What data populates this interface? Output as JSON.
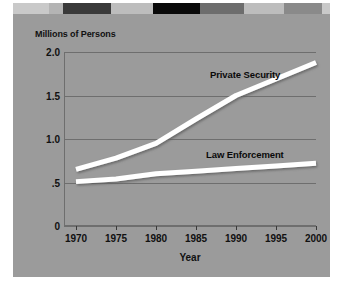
{
  "figure": {
    "background_color": "#9b9b9b",
    "page_color": "#ffffff",
    "series_line_color": "#ffffff",
    "gridline_color": "#6e6e6e",
    "text_color": "#111111"
  },
  "decorative_band": {
    "name": "top-decorative-band",
    "segments": [
      {
        "x": 0,
        "width": 36,
        "color": "#c9c9c9"
      },
      {
        "x": 36,
        "width": 14,
        "color": "#b4b4b4"
      },
      {
        "x": 50,
        "width": 48,
        "color": "#3a3a3a"
      },
      {
        "x": 98,
        "width": 42,
        "color": "#bdbdbd"
      },
      {
        "x": 140,
        "width": 47,
        "color": "#0a0a0a"
      },
      {
        "x": 187,
        "width": 44,
        "color": "#6d6d6d"
      },
      {
        "x": 231,
        "width": 40,
        "color": "#bdbdbd"
      },
      {
        "x": 271,
        "width": 38,
        "color": "#8a8a8a"
      },
      {
        "x": 309,
        "width": 8,
        "color": "#c9c9c9"
      }
    ]
  },
  "chart_data": {
    "type": "line",
    "title": "",
    "xlabel": "Year",
    "ylabel": "Millions of Persons",
    "x": [
      1970,
      1975,
      1980,
      1985,
      1990,
      1995,
      2000
    ],
    "xlim": [
      1968.5,
      2000
    ],
    "ylim": [
      0,
      2.0
    ],
    "ytick_labels": [
      "2.0",
      "1.5",
      "1.0",
      ".5",
      "0"
    ],
    "ytick_values": [
      2.0,
      1.5,
      1.0,
      0.5,
      0
    ],
    "xtick_labels": [
      "1970",
      "1975",
      "1980",
      "1985",
      "1990",
      "1995",
      "2000"
    ],
    "grid": true,
    "legend": "inline-annotations",
    "series": [
      {
        "name": "Private Security",
        "values": [
          0.65,
          0.78,
          0.95,
          1.23,
          1.5,
          1.69,
          1.88
        ],
        "color": "#ffffff"
      },
      {
        "name": "Law Enforcement",
        "values": [
          0.51,
          0.54,
          0.6,
          0.63,
          0.66,
          0.69,
          0.72
        ],
        "color": "#ffffff"
      }
    ],
    "annotations": [
      {
        "text": "Private Security",
        "series": "Private Security"
      },
      {
        "text": "Law Enforcement",
        "series": "Law Enforcement"
      }
    ]
  }
}
